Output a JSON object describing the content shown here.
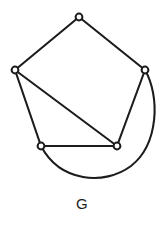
{
  "figure": {
    "caption": "G",
    "caption_position": {
      "x": 82,
      "y": 209
    },
    "canvas": {
      "width": 168,
      "height": 228
    },
    "background_color": "#ffffff",
    "ink_color": "#1c1c1c"
  },
  "graph": {
    "name": "G",
    "vertex_count": 5,
    "edge_count": 7,
    "vertex_radius": 3.4,
    "stroke_width": 2.1,
    "vertices": [
      {
        "id": "v-top",
        "label": "",
        "x": 79,
        "y": 17
      },
      {
        "id": "v-left",
        "label": "",
        "x": 15,
        "y": 70
      },
      {
        "id": "v-right",
        "label": "",
        "x": 145,
        "y": 70
      },
      {
        "id": "v-bottom-left",
        "label": "",
        "x": 41,
        "y": 146
      },
      {
        "id": "v-bottom-right",
        "label": "",
        "x": 117,
        "y": 146
      }
    ],
    "edges": [
      {
        "id": "e-top-left",
        "from": "v-top",
        "to": "v-left",
        "shape": "line",
        "path": "M 79 17 L 15 70"
      },
      {
        "id": "e-top-right",
        "from": "v-top",
        "to": "v-right",
        "shape": "line",
        "path": "M 79 17 L 145 70"
      },
      {
        "id": "e-left-bottomleft",
        "from": "v-left",
        "to": "v-bottom-left",
        "shape": "line",
        "path": "M 15 70 L 41 146"
      },
      {
        "id": "e-left-bottomright",
        "from": "v-left",
        "to": "v-bottom-right",
        "shape": "line",
        "path": "M 15 70 L 117 146"
      },
      {
        "id": "e-bottom",
        "from": "v-bottom-left",
        "to": "v-bottom-right",
        "shape": "line",
        "path": "M 41 146 L 117 146"
      },
      {
        "id": "e-right-bottomright",
        "from": "v-right",
        "to": "v-bottom-right",
        "shape": "line",
        "path": "M 145 70 L 117 146"
      },
      {
        "id": "e-right-bottomleft-arc",
        "from": "v-right",
        "to": "v-bottom-left",
        "shape": "arc",
        "path": "M 145 70 C 160 96 159 144 131 166 C 104 186 60 182 41 146"
      }
    ]
  }
}
